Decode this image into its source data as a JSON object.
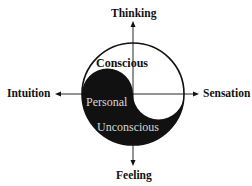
{
  "diagram": {
    "axes": {
      "top": "Thinking",
      "bottom": "Feeling",
      "left": "Intuition",
      "right": "Sensation"
    },
    "regions": {
      "conscious": "Conscious",
      "personal": "Personal",
      "unconscious": "Unconscious"
    },
    "colors": {
      "ink": "#111111",
      "background": "#ffffff",
      "inner_text_on_dark": "#d8d8d8"
    }
  }
}
